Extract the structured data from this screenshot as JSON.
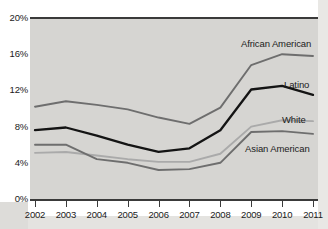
{
  "chart_data": {
    "type": "line",
    "title": "",
    "subtitle": "",
    "xlabel": "",
    "ylabel": "",
    "grid": false,
    "legend_position": "inline-right-annotations",
    "categories": [
      "2002",
      "2003",
      "2004",
      "2005",
      "2006",
      "2007",
      "2008",
      "2009",
      "2010",
      "2011"
    ],
    "x_tick_labels": [
      "2002",
      "2003",
      "2004",
      "2005",
      "2006",
      "2007",
      "2008",
      "2009",
      "2010",
      "2011"
    ],
    "y_tick_labels": [
      "20%",
      "16%",
      "12%",
      "8%",
      "4%",
      "0%"
    ],
    "y_tick_values": [
      20,
      16,
      12,
      8,
      4,
      0
    ],
    "ylim": [
      0,
      20
    ],
    "y_unit": "%",
    "series": [
      {
        "name": "African American",
        "color": "#6e6e6e",
        "values": [
          10.2,
          10.8,
          10.4,
          9.9,
          9.0,
          8.3,
          10.1,
          14.8,
          16.0,
          15.8
        ]
      },
      {
        "name": "Latino",
        "color": "#141414",
        "values": [
          7.6,
          7.9,
          7.0,
          6.0,
          5.2,
          5.6,
          7.6,
          12.1,
          12.5,
          11.5
        ]
      },
      {
        "name": "White",
        "color": "#aaaaaa",
        "values": [
          5.1,
          5.2,
          4.8,
          4.4,
          4.1,
          4.1,
          5.0,
          8.0,
          8.7,
          8.6
        ]
      },
      {
        "name": "Asian American",
        "color": "#6e6e6e",
        "values": [
          6.0,
          6.0,
          4.4,
          4.0,
          3.2,
          3.3,
          4.0,
          7.4,
          7.5,
          7.2
        ]
      }
    ],
    "annotations": [
      {
        "text": "African American",
        "series": "African American"
      },
      {
        "text": "Latino",
        "series": "Latino"
      },
      {
        "text": "White",
        "series": "White"
      },
      {
        "text": "Asian American",
        "series": "Asian American"
      }
    ]
  },
  "colors": {
    "plot_background": "#d6d5d2",
    "axis": "#3a3a3a",
    "text": "#1b1b1b",
    "page_background": "#ffffff"
  }
}
